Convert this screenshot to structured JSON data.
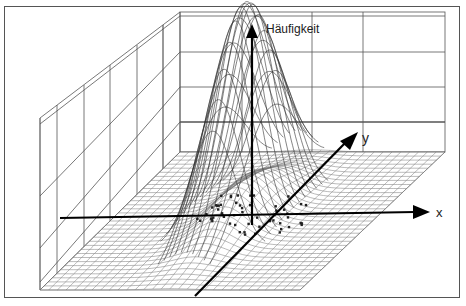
{
  "figure": {
    "type": "3d-surface-plot",
    "axes": {
      "z_label": "Häufigkeit",
      "y_label": "y",
      "x_label": "x"
    }
  }
}
